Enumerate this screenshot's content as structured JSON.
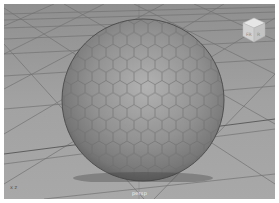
{
  "viewport": {
    "camera_label": "persp",
    "background_color": "#9a9a9a",
    "grid_color": "#6e6e6e",
    "object": {
      "type": "sphere",
      "pattern": "hexagon",
      "base_color": "#8c8c8c",
      "highlight_color": "#b4b4b4",
      "edge_color": "#6f6f6f"
    },
    "viewcube": {
      "icon": "viewcube-icon",
      "face_left_label": "FR",
      "face_right_label": "R"
    },
    "axis_indicator": {
      "label": "x z"
    }
  }
}
